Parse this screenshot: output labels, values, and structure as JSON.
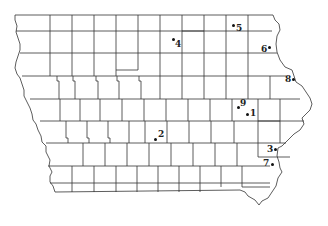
{
  "map": {
    "title": "Iowa counties",
    "line_color": "#333333",
    "background": "#ffffff"
  },
  "points": [
    {
      "id": "1",
      "label": "1",
      "dot_x": 247,
      "dot_y": 114,
      "label_x": 250,
      "label_y": 109
    },
    {
      "id": "2",
      "label": "2",
      "dot_x": 155,
      "dot_y": 139,
      "label_x": 158,
      "label_y": 130
    },
    {
      "id": "3",
      "label": "3",
      "dot_x": 275,
      "dot_y": 149,
      "label_x": 267,
      "label_y": 145
    },
    {
      "id": "4",
      "label": "4",
      "dot_x": 173,
      "dot_y": 39,
      "label_x": 175,
      "label_y": 40
    },
    {
      "id": "5",
      "label": "5",
      "dot_x": 233,
      "dot_y": 25,
      "label_x": 236,
      "label_y": 24
    },
    {
      "id": "6",
      "label": "6",
      "dot_x": 269,
      "dot_y": 47,
      "label_x": 261,
      "label_y": 45
    },
    {
      "id": "7",
      "label": "7",
      "dot_x": 272,
      "dot_y": 164,
      "label_x": 263,
      "label_y": 159
    },
    {
      "id": "8",
      "label": "8",
      "dot_x": 293,
      "dot_y": 79,
      "label_x": 285,
      "label_y": 75
    },
    {
      "id": "9",
      "label": "9",
      "dot_x": 238,
      "dot_y": 107,
      "label_x": 240,
      "label_y": 99
    }
  ]
}
